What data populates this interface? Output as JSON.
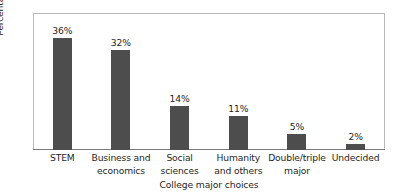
{
  "chart_data": {
    "type": "bar",
    "title": "",
    "xlabel": "College major choices",
    "ylabel": "Percentage of respondents",
    "categories": [
      "STEM",
      "Business and economics",
      "Social sciences",
      "Humanity and others",
      "Double/triple major",
      "Undecided"
    ],
    "category_lines": [
      [
        "STEM"
      ],
      [
        "Business and",
        "economics"
      ],
      [
        "Social",
        "sciences"
      ],
      [
        "Humanity",
        "and others"
      ],
      [
        "Double/triple",
        "major"
      ],
      [
        "Undecided"
      ]
    ],
    "values": [
      36,
      32,
      14,
      11,
      5,
      2
    ],
    "value_labels": [
      "36%",
      "32%",
      "14%",
      "11%",
      "5%",
      "2%"
    ],
    "ylim": [
      0,
      44
    ],
    "grid": false,
    "legend": false,
    "y_tick_labels": [],
    "bar_color": "#4d4d4d",
    "frame_color": "#b9b9b9",
    "axis_color": "#7a7a7a",
    "background_color": "#ffffff",
    "text_color": "#1f1f1f"
  }
}
